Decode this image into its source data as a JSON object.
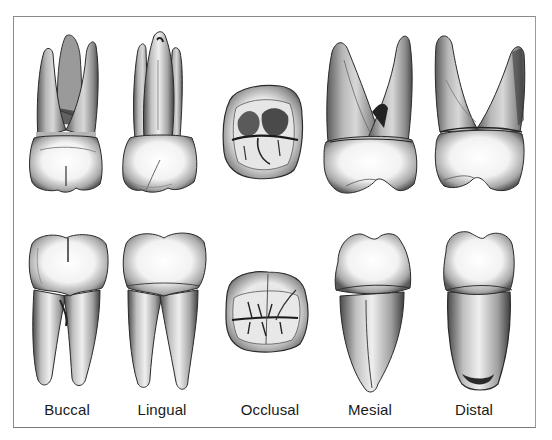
{
  "figure": {
    "rows": [
      {
        "id": "top",
        "description": "maxillary molar"
      },
      {
        "id": "bottom",
        "description": "mandibular molar"
      }
    ],
    "views": [
      {
        "label": "Buccal"
      },
      {
        "label": "Lingual"
      },
      {
        "label": "Occlusal"
      },
      {
        "label": "Mesial"
      },
      {
        "label": "Distal"
      }
    ],
    "colors": {
      "frame": "#8a8a8a",
      "ink": "#1a1a1a",
      "background": "#ffffff"
    }
  }
}
